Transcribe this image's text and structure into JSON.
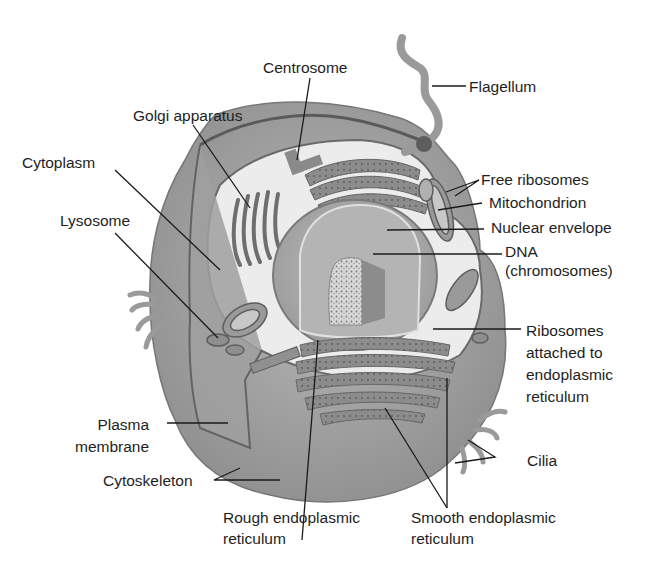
{
  "diagram": {
    "colors": {
      "background": "#ffffff",
      "outer_cell": "#9a9a9a",
      "cytoplasm": "#e8e8e8",
      "nucleus": "#a8a8a8",
      "label_text": "#1e1e1e",
      "leader_line": "#1a1a1a"
    },
    "labels": {
      "centrosome": "Centrosome",
      "flagellum": "Flagellum",
      "golgi": "Golgi apparatus",
      "cytoplasm": "Cytoplasm",
      "free_ribosomes": "Free ribosomes",
      "mitochondrion": "Mitochondrion",
      "nuclear_envelope": "Nuclear envelope",
      "dna_line1": "DNA",
      "dna_line2": "(chromosomes)",
      "lysosome": "Lysosome",
      "ribosomes_attached_line1": "Ribosomes",
      "ribosomes_attached_line2": "attached to",
      "ribosomes_attached_line3": "endoplasmic",
      "ribosomes_attached_line4": "reticulum",
      "plasma_membrane_line1": "Plasma",
      "plasma_membrane_line2": "membrane",
      "cilia": "Cilia",
      "cytoskeleton": "Cytoskeleton",
      "rough_er_line1": "Rough endoplasmic",
      "rough_er_line2": "reticulum",
      "smooth_er_line1": "Smooth endoplasmic",
      "smooth_er_line2": "reticulum"
    }
  }
}
